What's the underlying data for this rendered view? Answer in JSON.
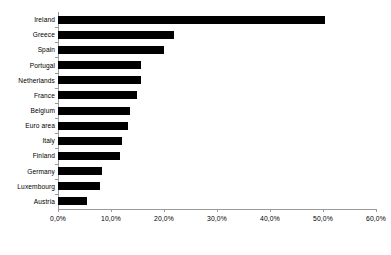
{
  "chart_data": {
    "type": "bar",
    "orientation": "horizontal",
    "title": "",
    "subtitle": "",
    "xlabel": "",
    "ylabel": "",
    "grid": false,
    "legend": null,
    "xlim": [
      0,
      60
    ],
    "xtick_labels": [
      "0,0%",
      "10,0%",
      "20,0%",
      "30,0%",
      "40,0%",
      "50,0%",
      "60,0%"
    ],
    "xtick_values": [
      0,
      10,
      20,
      30,
      40,
      50,
      60
    ],
    "bar_color": "#000000",
    "axis_color": "#9a9a9a",
    "background_color": "#ffffff",
    "categories": [
      "Ireland",
      "Greece",
      "Spain",
      "Portugal",
      "Netherlands",
      "France",
      "Belgium",
      "Euro area",
      "Italy",
      "Finland",
      "Germany",
      "Luxembourg",
      "Austria"
    ],
    "values": [
      50.4,
      21.8,
      20.0,
      15.7,
      15.7,
      14.9,
      13.6,
      13.2,
      12.1,
      11.7,
      8.3,
      7.9,
      5.4
    ]
  }
}
